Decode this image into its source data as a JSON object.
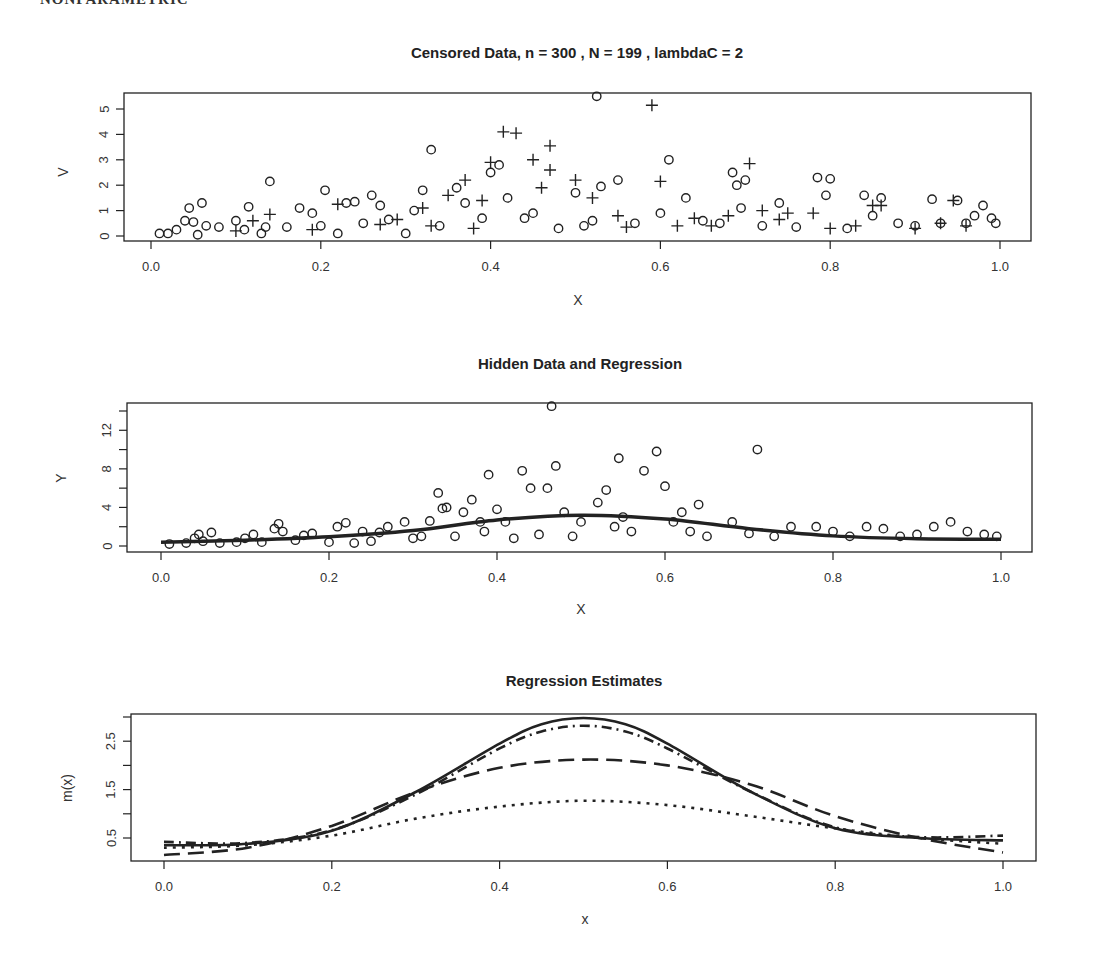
{
  "header_cutoff_text": "NONPARAMETRIC",
  "chart_data": [
    {
      "type": "scatter",
      "title": "Censored Data,  n =   300 , N  =  199 ,  lambdaC =  2",
      "xlabel": "X",
      "ylabel": "V",
      "xlim": [
        -0.03,
        1.04
      ],
      "ylim": [
        0,
        5.5
      ],
      "x_ticks": [
        "0.0",
        "0.2",
        "0.4",
        "0.6",
        "0.8",
        "1.0"
      ],
      "y_ticks": [
        "0",
        "1",
        "2",
        "3",
        "4",
        "5"
      ],
      "grid": false,
      "legend": null,
      "series": [
        {
          "name": "uncensored (circle)",
          "marker": "circle",
          "points": [
            [
              0.01,
              0.1
            ],
            [
              0.02,
              0.1
            ],
            [
              0.03,
              0.25
            ],
            [
              0.04,
              0.6
            ],
            [
              0.045,
              1.1
            ],
            [
              0.05,
              0.55
            ],
            [
              0.055,
              0.05
            ],
            [
              0.06,
              1.3
            ],
            [
              0.065,
              0.4
            ],
            [
              0.08,
              0.35
            ],
            [
              0.1,
              0.6
            ],
            [
              0.11,
              0.25
            ],
            [
              0.115,
              1.15
            ],
            [
              0.13,
              0.1
            ],
            [
              0.135,
              0.35
            ],
            [
              0.14,
              2.15
            ],
            [
              0.16,
              0.35
            ],
            [
              0.175,
              1.1
            ],
            [
              0.19,
              0.9
            ],
            [
              0.2,
              0.4
            ],
            [
              0.205,
              1.8
            ],
            [
              0.22,
              0.1
            ],
            [
              0.23,
              1.3
            ],
            [
              0.24,
              1.35
            ],
            [
              0.25,
              0.5
            ],
            [
              0.26,
              1.6
            ],
            [
              0.27,
              1.2
            ],
            [
              0.28,
              0.65
            ],
            [
              0.3,
              0.1
            ],
            [
              0.31,
              1.0
            ],
            [
              0.32,
              1.8
            ],
            [
              0.33,
              3.4
            ],
            [
              0.34,
              0.4
            ],
            [
              0.36,
              1.9
            ],
            [
              0.37,
              1.3
            ],
            [
              0.39,
              0.7
            ],
            [
              0.4,
              2.5
            ],
            [
              0.41,
              2.8
            ],
            [
              0.42,
              1.5
            ],
            [
              0.44,
              0.7
            ],
            [
              0.45,
              0.9
            ],
            [
              0.48,
              0.3
            ],
            [
              0.5,
              1.7
            ],
            [
              0.51,
              0.4
            ],
            [
              0.52,
              0.6
            ],
            [
              0.525,
              5.5
            ],
            [
              0.53,
              1.95
            ],
            [
              0.55,
              2.2
            ],
            [
              0.57,
              0.5
            ],
            [
              0.6,
              0.9
            ],
            [
              0.61,
              3.0
            ],
            [
              0.63,
              1.5
            ],
            [
              0.65,
              0.6
            ],
            [
              0.67,
              0.5
            ],
            [
              0.685,
              2.5
            ],
            [
              0.69,
              2.0
            ],
            [
              0.695,
              1.1
            ],
            [
              0.7,
              2.2
            ],
            [
              0.72,
              0.4
            ],
            [
              0.74,
              1.3
            ],
            [
              0.76,
              0.35
            ],
            [
              0.785,
              2.3
            ],
            [
              0.795,
              1.6
            ],
            [
              0.8,
              2.25
            ],
            [
              0.82,
              0.3
            ],
            [
              0.84,
              1.6
            ],
            [
              0.85,
              0.8
            ],
            [
              0.86,
              1.5
            ],
            [
              0.88,
              0.5
            ],
            [
              0.9,
              0.4
            ],
            [
              0.92,
              1.45
            ],
            [
              0.93,
              0.5
            ],
            [
              0.95,
              1.4
            ],
            [
              0.96,
              0.5
            ],
            [
              0.97,
              0.8
            ],
            [
              0.98,
              1.2
            ],
            [
              0.99,
              0.7
            ],
            [
              0.995,
              0.5
            ]
          ]
        },
        {
          "name": "censored (plus)",
          "marker": "plus",
          "points": [
            [
              0.1,
              0.2
            ],
            [
              0.12,
              0.6
            ],
            [
              0.14,
              0.85
            ],
            [
              0.19,
              0.25
            ],
            [
              0.22,
              1.25
            ],
            [
              0.27,
              0.45
            ],
            [
              0.29,
              0.65
            ],
            [
              0.32,
              1.1
            ],
            [
              0.33,
              0.4
            ],
            [
              0.35,
              1.6
            ],
            [
              0.37,
              2.2
            ],
            [
              0.38,
              0.3
            ],
            [
              0.39,
              1.4
            ],
            [
              0.4,
              2.9
            ],
            [
              0.415,
              4.1
            ],
            [
              0.43,
              4.05
            ],
            [
              0.45,
              3.0
            ],
            [
              0.46,
              1.9
            ],
            [
              0.47,
              3.55
            ],
            [
              0.47,
              2.6
            ],
            [
              0.5,
              2.2
            ],
            [
              0.52,
              1.5
            ],
            [
              0.55,
              0.8
            ],
            [
              0.56,
              0.35
            ],
            [
              0.59,
              5.15
            ],
            [
              0.6,
              2.15
            ],
            [
              0.62,
              0.4
            ],
            [
              0.64,
              0.7
            ],
            [
              0.66,
              0.4
            ],
            [
              0.68,
              0.8
            ],
            [
              0.705,
              2.85
            ],
            [
              0.72,
              1.0
            ],
            [
              0.74,
              0.65
            ],
            [
              0.75,
              0.9
            ],
            [
              0.78,
              0.9
            ],
            [
              0.8,
              0.3
            ],
            [
              0.83,
              0.4
            ],
            [
              0.85,
              1.2
            ],
            [
              0.86,
              1.2
            ],
            [
              0.9,
              0.3
            ],
            [
              0.93,
              0.5
            ],
            [
              0.945,
              1.4
            ],
            [
              0.96,
              0.4
            ]
          ]
        }
      ]
    },
    {
      "type": "scatter",
      "title": "Hidden Data and Regression",
      "xlabel": "X",
      "ylabel": "Y",
      "xlim": [
        -0.04,
        1.04
      ],
      "ylim": [
        0,
        14.8
      ],
      "x_ticks": [
        "0.0",
        "0.2",
        "0.4",
        "0.6",
        "0.8",
        "1.0"
      ],
      "y_ticks": [
        "0",
        "4",
        "8",
        "12"
      ],
      "y_minor_ticks": [
        2,
        6,
        10,
        14
      ],
      "grid": false,
      "series": [
        {
          "name": "hidden data",
          "marker": "circle",
          "points": [
            [
              0.01,
              0.2
            ],
            [
              0.03,
              0.3
            ],
            [
              0.04,
              0.8
            ],
            [
              0.045,
              1.2
            ],
            [
              0.05,
              0.5
            ],
            [
              0.06,
              1.4
            ],
            [
              0.07,
              0.3
            ],
            [
              0.09,
              0.4
            ],
            [
              0.1,
              0.8
            ],
            [
              0.11,
              1.2
            ],
            [
              0.12,
              0.4
            ],
            [
              0.135,
              1.8
            ],
            [
              0.14,
              2.3
            ],
            [
              0.145,
              1.5
            ],
            [
              0.16,
              0.6
            ],
            [
              0.17,
              1.1
            ],
            [
              0.18,
              1.3
            ],
            [
              0.2,
              0.4
            ],
            [
              0.21,
              2.0
            ],
            [
              0.22,
              2.4
            ],
            [
              0.23,
              0.3
            ],
            [
              0.24,
              1.5
            ],
            [
              0.25,
              0.5
            ],
            [
              0.26,
              1.4
            ],
            [
              0.27,
              2.0
            ],
            [
              0.29,
              2.5
            ],
            [
              0.3,
              0.8
            ],
            [
              0.31,
              1.0
            ],
            [
              0.32,
              2.6
            ],
            [
              0.33,
              5.5
            ],
            [
              0.335,
              3.9
            ],
            [
              0.34,
              4.0
            ],
            [
              0.35,
              1.0
            ],
            [
              0.36,
              3.5
            ],
            [
              0.37,
              4.8
            ],
            [
              0.38,
              2.5
            ],
            [
              0.385,
              1.5
            ],
            [
              0.39,
              7.4
            ],
            [
              0.4,
              3.8
            ],
            [
              0.41,
              2.5
            ],
            [
              0.42,
              0.8
            ],
            [
              0.43,
              7.8
            ],
            [
              0.44,
              6.0
            ],
            [
              0.45,
              1.2
            ],
            [
              0.46,
              6.0
            ],
            [
              0.465,
              14.5
            ],
            [
              0.47,
              8.3
            ],
            [
              0.48,
              3.5
            ],
            [
              0.49,
              1.0
            ],
            [
              0.5,
              2.5
            ],
            [
              0.52,
              4.5
            ],
            [
              0.53,
              5.8
            ],
            [
              0.54,
              2.0
            ],
            [
              0.545,
              9.1
            ],
            [
              0.55,
              3.0
            ],
            [
              0.56,
              1.5
            ],
            [
              0.575,
              7.8
            ],
            [
              0.59,
              9.8
            ],
            [
              0.6,
              6.2
            ],
            [
              0.61,
              2.5
            ],
            [
              0.62,
              3.5
            ],
            [
              0.63,
              1.5
            ],
            [
              0.64,
              4.3
            ],
            [
              0.65,
              1.0
            ],
            [
              0.68,
              2.5
            ],
            [
              0.7,
              1.3
            ],
            [
              0.71,
              10.0
            ],
            [
              0.73,
              1.0
            ],
            [
              0.75,
              2.0
            ],
            [
              0.78,
              2.0
            ],
            [
              0.8,
              1.5
            ],
            [
              0.82,
              1.0
            ],
            [
              0.84,
              2.0
            ],
            [
              0.86,
              1.8
            ],
            [
              0.88,
              1.0
            ],
            [
              0.9,
              1.2
            ],
            [
              0.92,
              2.0
            ],
            [
              0.94,
              2.5
            ],
            [
              0.96,
              1.5
            ],
            [
              0.98,
              1.2
            ],
            [
              0.995,
              1.0
            ]
          ]
        },
        {
          "name": "true regression m(x)",
          "marker": "line-solid-thick",
          "points": [
            [
              0.0,
              0.4
            ],
            [
              0.1,
              0.6
            ],
            [
              0.2,
              0.95
            ],
            [
              0.3,
              1.6
            ],
            [
              0.4,
              2.7
            ],
            [
              0.5,
              3.2
            ],
            [
              0.6,
              2.8
            ],
            [
              0.7,
              1.8
            ],
            [
              0.8,
              1.05
            ],
            [
              0.9,
              0.75
            ],
            [
              1.0,
              0.7
            ]
          ]
        }
      ]
    },
    {
      "type": "line",
      "title": "Regression Estimates",
      "xlabel": "x",
      "ylabel": "m(x)",
      "xlim": [
        -0.04,
        1.04
      ],
      "ylim": [
        0.05,
        3.05
      ],
      "x_ticks": [
        "0.0",
        "0.2",
        "0.4",
        "0.6",
        "0.8",
        "1.0"
      ],
      "y_ticks": [
        "0.5",
        "1.5",
        "2.5"
      ],
      "y_minor_ticks": [
        1.0,
        2.0,
        3.0
      ],
      "grid": false,
      "series": [
        {
          "name": "true m(x)",
          "style": "solid",
          "x": [
            0.0,
            0.1,
            0.2,
            0.3,
            0.4,
            0.45,
            0.5,
            0.55,
            0.6,
            0.7,
            0.8,
            0.9,
            1.0
          ],
          "values": [
            0.35,
            0.38,
            0.65,
            1.45,
            2.45,
            2.85,
            2.98,
            2.85,
            2.45,
            1.45,
            0.7,
            0.5,
            0.45
          ]
        },
        {
          "name": "estimate A",
          "style": "dashdot",
          "x": [
            0.0,
            0.1,
            0.2,
            0.3,
            0.4,
            0.45,
            0.5,
            0.55,
            0.6,
            0.7,
            0.8,
            0.9,
            1.0
          ],
          "values": [
            0.42,
            0.4,
            0.66,
            1.4,
            2.35,
            2.7,
            2.82,
            2.7,
            2.35,
            1.45,
            0.72,
            0.52,
            0.55
          ]
        },
        {
          "name": "estimate B",
          "style": "dashed",
          "x": [
            0.0,
            0.1,
            0.2,
            0.3,
            0.4,
            0.5,
            0.6,
            0.7,
            0.8,
            0.9,
            1.0
          ],
          "values": [
            0.15,
            0.3,
            0.75,
            1.45,
            1.95,
            2.12,
            2.0,
            1.6,
            0.95,
            0.5,
            0.2
          ]
        },
        {
          "name": "estimate C",
          "style": "dotted",
          "x": [
            0.0,
            0.1,
            0.2,
            0.3,
            0.4,
            0.5,
            0.6,
            0.7,
            0.8,
            0.9,
            1.0
          ],
          "values": [
            0.3,
            0.35,
            0.55,
            0.9,
            1.15,
            1.27,
            1.18,
            0.95,
            0.7,
            0.5,
            0.38
          ]
        }
      ]
    }
  ]
}
